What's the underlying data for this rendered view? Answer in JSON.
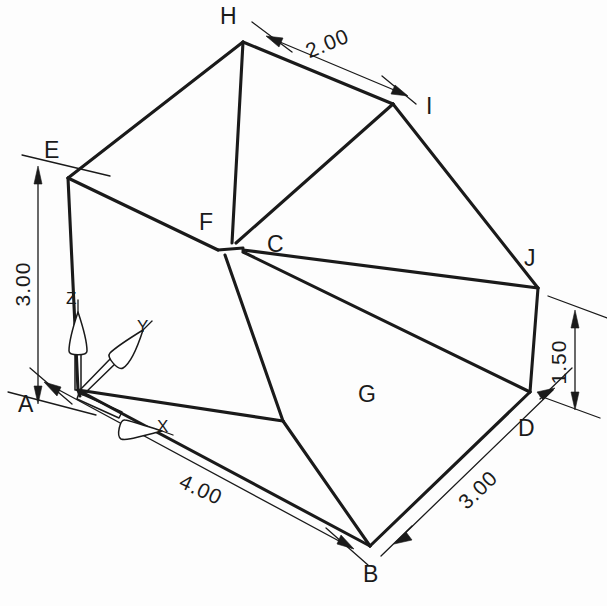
{
  "drawing": {
    "title": "Isometric Pictorial Drawing",
    "type": "isometric-technical-drawing",
    "line_color": "#1a1a1a",
    "background_color": "#fdfdfd",
    "vertices": [
      {
        "id": "A",
        "label": "A",
        "x": 78,
        "y": 390,
        "label_x": 18,
        "label_y": 412
      },
      {
        "id": "B",
        "label": "B",
        "x": 370,
        "y": 546,
        "label_x": 368,
        "label_y": 579
      },
      {
        "id": "C",
        "label": "C",
        "x": 243,
        "y": 248,
        "label_x": 272,
        "label_y": 250
      },
      {
        "id": "D",
        "label": "D",
        "x": 530,
        "y": 392,
        "label_x": 525,
        "label_y": 434
      },
      {
        "id": "E",
        "label": "E",
        "x": 68,
        "y": 178,
        "label_x": 47,
        "label_y": 156
      },
      {
        "id": "F",
        "label": "F",
        "x": 218,
        "y": 250,
        "label_x": 201,
        "label_y": 228
      },
      {
        "id": "G",
        "label": "G",
        "x": 283,
        "y": 421,
        "label_x": 363,
        "label_y": 400
      },
      {
        "id": "H",
        "label": "H",
        "x": 243,
        "y": 42,
        "label_x": 222,
        "label_y": 21
      },
      {
        "id": "I",
        "label": "I",
        "x": 393,
        "y": 104,
        "label_x": 428,
        "label_y": 113
      },
      {
        "id": "J",
        "label": "J",
        "x": 538,
        "y": 288,
        "label_x": 527,
        "label_y": 264
      }
    ],
    "dimensions": [
      {
        "id": "dim-height-left",
        "value": "3.00",
        "text_x": 30,
        "text_y": 284,
        "rotation": -90
      },
      {
        "id": "dim-top-width",
        "value": "2.00",
        "text_x": 318,
        "text_y": 56,
        "rotation": -30
      },
      {
        "id": "dim-height-right",
        "value": "1.50",
        "text_x": 565,
        "text_y": 364,
        "rotation": -90
      },
      {
        "id": "dim-depth-right",
        "value": "3.00",
        "text_x": 481,
        "text_y": 503,
        "rotation": -60
      },
      {
        "id": "dim-front-width",
        "value": "4.00",
        "text_x": 165,
        "text_y": 500,
        "rotation": 30
      }
    ],
    "axis_indicator": {
      "origin_label": "A",
      "axes": [
        {
          "id": "axis-z",
          "label": "Z",
          "label_x": 66,
          "label_y": 304
        },
        {
          "id": "axis-y",
          "label": "Y",
          "label_x": 141,
          "label_y": 334
        },
        {
          "id": "axis-x",
          "label": "X",
          "label_x": 161,
          "label_y": 436
        }
      ]
    },
    "edges": [
      {
        "id": "edge-A-B",
        "from": "A",
        "to": "B"
      },
      {
        "id": "edge-B-D",
        "from": "B",
        "to": "D"
      },
      {
        "id": "edge-D-J",
        "from": "D",
        "to": "J"
      },
      {
        "id": "edge-A-E",
        "from": "A",
        "to": "E"
      },
      {
        "id": "edge-E-H",
        "from": "E",
        "to": "H"
      },
      {
        "id": "edge-H-I",
        "from": "H",
        "to": "I"
      },
      {
        "id": "edge-I-J",
        "from": "I",
        "to": "J"
      },
      {
        "id": "edge-E-F",
        "from": "E",
        "to": "F"
      },
      {
        "id": "edge-F-H",
        "from": "F",
        "to": "H"
      },
      {
        "id": "edge-F-C",
        "from": "F",
        "to": "C"
      },
      {
        "id": "edge-C-I",
        "from": "C",
        "to": "I"
      },
      {
        "id": "edge-C-J",
        "from": "C",
        "to": "J"
      },
      {
        "id": "edge-F-G",
        "from": "F",
        "to": "G"
      },
      {
        "id": "edge-G-B",
        "from": "G",
        "to": "B"
      },
      {
        "id": "edge-C-D",
        "from": "C",
        "to": "D"
      },
      {
        "id": "edge-A-G",
        "from": "A",
        "to": "G"
      }
    ]
  }
}
